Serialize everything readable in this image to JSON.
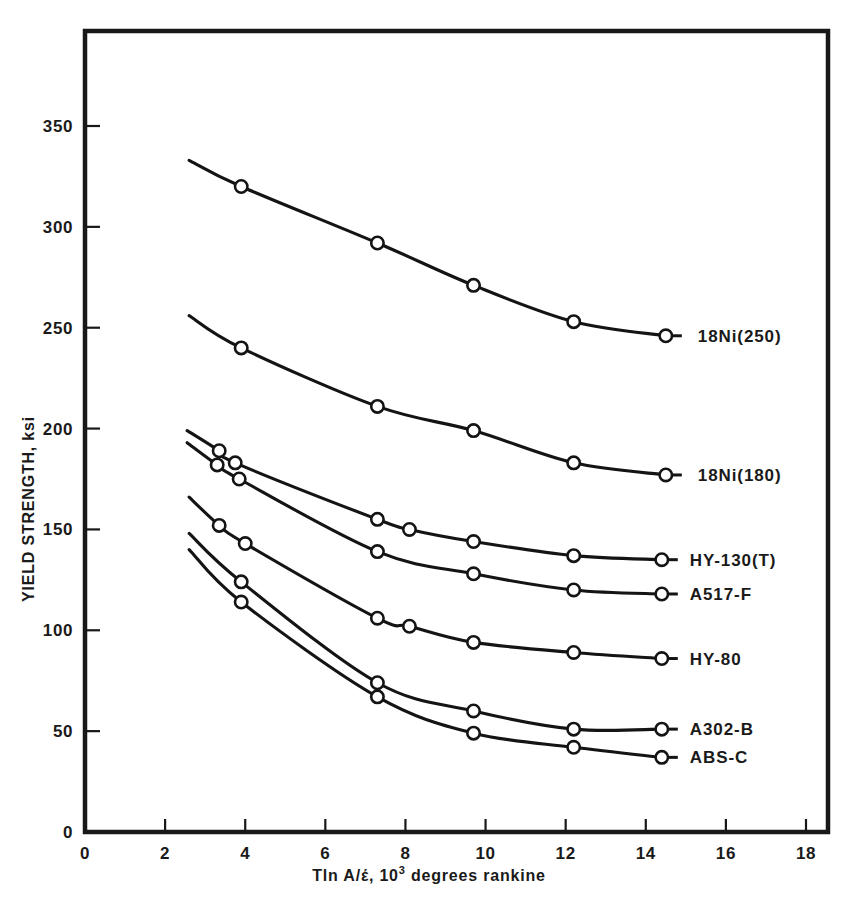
{
  "chart_data": {
    "type": "line",
    "title": "",
    "xlabel": "Tln A/έ, 10³ degrees rankine",
    "xlabel_main": "Tln A/έ, 10",
    "xlabel_sup": "3",
    "xlabel_tail": " degrees rankine",
    "ylabel": "YIELD STRENGTH, ksi",
    "xlim": [
      0,
      18
    ],
    "ylim": [
      0,
      375
    ],
    "grid": false,
    "legend_position": "right-inline",
    "xticks": [
      0,
      2,
      4,
      6,
      8,
      10,
      12,
      14,
      16,
      18
    ],
    "xticklabels": [
      "0",
      "2",
      "4",
      "6",
      "8",
      "10",
      "12",
      "14",
      "16",
      "18"
    ],
    "yticks": [
      0,
      50,
      100,
      150,
      200,
      250,
      300,
      350
    ],
    "yticklabels": [
      "0",
      "50",
      "100",
      "150",
      "200",
      "250",
      "300",
      "350"
    ],
    "series": [
      {
        "name": "18Ni(250)",
        "label": "18Ni(250)",
        "x": [
          2.6,
          3.9,
          7.3,
          9.7,
          12.2,
          14.5
        ],
        "y": [
          333,
          320,
          292,
          271,
          253,
          246
        ],
        "markers": [
          false,
          true,
          true,
          true,
          true,
          true
        ],
        "label_x": 15.3,
        "label_y": 246
      },
      {
        "name": "18Ni(180)",
        "label": "18Ni(180)",
        "x": [
          2.6,
          3.9,
          7.3,
          9.7,
          12.2,
          14.5
        ],
        "y": [
          256,
          240,
          211,
          199,
          183,
          177
        ],
        "markers": [
          false,
          true,
          true,
          true,
          true,
          true
        ],
        "label_x": 15.3,
        "label_y": 177
      },
      {
        "name": "HY-130(T)",
        "label": "HY-130(T)",
        "x": [
          2.55,
          3.35,
          3.75,
          7.3,
          8.1,
          9.7,
          12.2,
          14.4
        ],
        "y": [
          199,
          189,
          183,
          155,
          150,
          144,
          137,
          135
        ],
        "markers": [
          false,
          true,
          true,
          true,
          true,
          true,
          true,
          true
        ],
        "label_x": 15.1,
        "label_y": 135
      },
      {
        "name": "A517-F",
        "label": "A517-F",
        "x": [
          2.55,
          3.3,
          3.85,
          7.3,
          9.7,
          12.2,
          14.4
        ],
        "y": [
          193,
          182,
          175,
          139,
          128,
          120,
          118
        ],
        "markers": [
          false,
          true,
          true,
          true,
          true,
          true,
          true
        ],
        "label_x": 15.1,
        "label_y": 118
      },
      {
        "name": "HY-80",
        "label": "HY-80",
        "x": [
          2.6,
          3.35,
          4.0,
          7.3,
          8.1,
          9.7,
          12.2,
          14.4
        ],
        "y": [
          166,
          152,
          143,
          106,
          102,
          94,
          89,
          86
        ],
        "markers": [
          false,
          true,
          true,
          true,
          true,
          true,
          true,
          true
        ],
        "label_x": 15.1,
        "label_y": 86
      },
      {
        "name": "A302-B",
        "label": "A302-B",
        "x": [
          2.6,
          3.9,
          7.3,
          9.7,
          12.2,
          14.4
        ],
        "y": [
          148,
          124,
          74,
          60,
          51,
          51
        ],
        "markers": [
          false,
          true,
          true,
          true,
          true,
          true
        ],
        "label_x": 15.1,
        "label_y": 51
      },
      {
        "name": "ABS-C",
        "label": "ABS-C",
        "x": [
          2.6,
          3.9,
          7.3,
          9.7,
          12.2,
          14.4
        ],
        "y": [
          140,
          114,
          67,
          49,
          42,
          37
        ],
        "markers": [
          false,
          true,
          true,
          true,
          true,
          true
        ],
        "label_x": 15.1,
        "label_y": 37
      }
    ]
  }
}
